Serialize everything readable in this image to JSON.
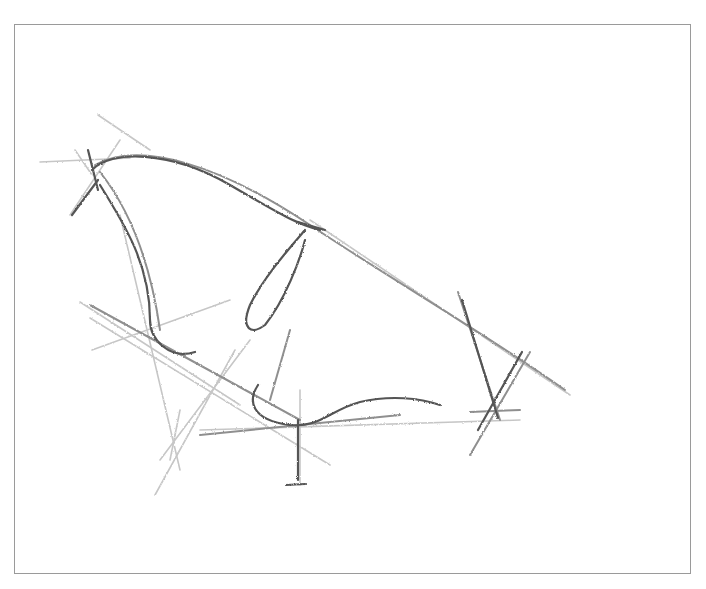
{
  "image": {
    "description": "Pencil construction sketch of a wing / butterfly-like form with guide lines, inside a thin gray frame",
    "frame": {
      "x": 14,
      "y": 24,
      "width": 677,
      "height": 550,
      "border_color": "#9a9a9a"
    },
    "background_color": "#ffffff",
    "stroke_colors": {
      "light": "#b8b8b8",
      "mid": "#8a8a8a",
      "dark": "#4a4a4a"
    },
    "elements": [
      {
        "name": "upper-arc",
        "type": "contour"
      },
      {
        "name": "left-lobe",
        "type": "contour"
      },
      {
        "name": "center-loop",
        "type": "contour"
      },
      {
        "name": "bottom-curve",
        "type": "contour"
      },
      {
        "name": "right-cross",
        "type": "construction"
      },
      {
        "name": "left-cross",
        "type": "construction"
      },
      {
        "name": "bottom-stem",
        "type": "construction"
      },
      {
        "name": "diagonal-guides",
        "type": "construction"
      }
    ]
  }
}
